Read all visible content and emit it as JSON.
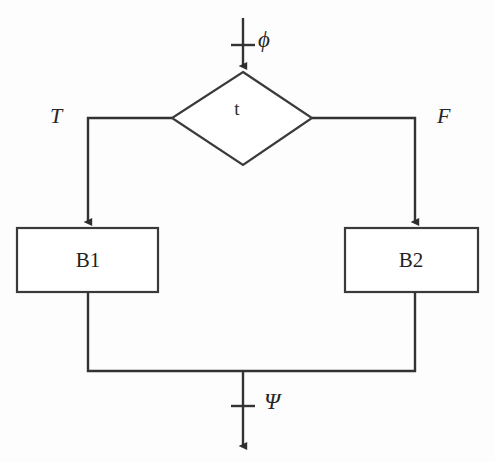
{
  "diagram": {
    "type": "flowchart",
    "background_color": "#fdfdfd",
    "line_color": "#333333",
    "text_color": "#262626",
    "entry": {
      "name": "entry-arrow",
      "label": "ϕ",
      "label_name": "phi",
      "tick": true
    },
    "decision": {
      "name": "decision-diamond",
      "label": "t",
      "shape": "diamond"
    },
    "branches": [
      {
        "name": "true-branch",
        "label": "T",
        "side": "left",
        "target": "B1"
      },
      {
        "name": "false-branch",
        "label": "F",
        "side": "right",
        "target": "B2"
      }
    ],
    "blocks": [
      {
        "name": "block-b1",
        "label": "B1",
        "shape": "rectangle"
      },
      {
        "name": "block-b2",
        "label": "B2",
        "shape": "rectangle"
      }
    ],
    "exit": {
      "name": "exit-arrow",
      "label": "Ψ",
      "label_name": "psi",
      "tick": true
    }
  }
}
